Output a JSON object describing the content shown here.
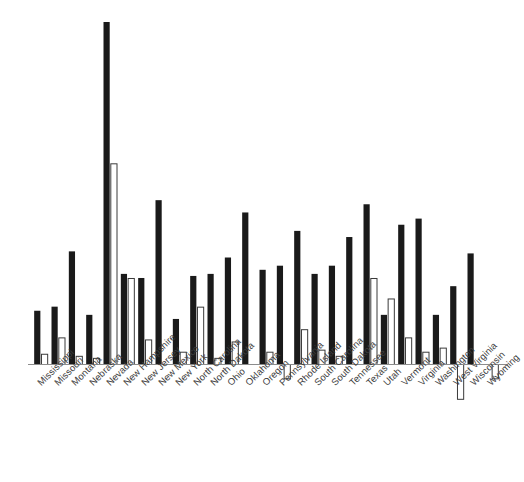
{
  "chart_data": {
    "type": "bar",
    "title": "",
    "subtitle": "",
    "xlabel": "",
    "ylabel": "",
    "grid": false,
    "legend_position": "none",
    "orientation": "vertical",
    "bar_style": "grouped-two-series",
    "ylim": [
      -20,
      340
    ],
    "axis_baseline": 0,
    "colors": {
      "series_dark": "#1a1a1a",
      "series_light": "#ffffff",
      "series_light_border": "#3a3a3a",
      "axis": "#8c8c8c",
      "label_text": "#3d3d3d",
      "background": "#ffffff"
    },
    "categories": [
      "Mississippi",
      "Missouri",
      "Montana",
      "Nebraska",
      "Nevada",
      "New Hampshire",
      "New Jersey",
      "New Mexico",
      "New York",
      "North Carolina",
      "North Dakota",
      "Ohio",
      "Oklahoma",
      "Oregon",
      "Pennsylvania",
      "Rhode Island",
      "South Carolina",
      "South Dakota",
      "Tennessee",
      "Texas",
      "Utah",
      "Vermont",
      "Virginia",
      "Washington",
      "West Virginia",
      "Wisconsin",
      "Wyoming"
    ],
    "series": [
      {
        "name": "series-dark",
        "values": [
          52,
          56,
          110,
          48,
          334,
          88,
          84,
          160,
          44,
          86,
          88,
          104,
          148,
          92,
          96,
          130,
          88,
          96,
          124,
          156,
          48,
          136,
          142,
          48,
          76,
          108,
          0
        ]
      },
      {
        "name": "series-light",
        "values": [
          10,
          26,
          8,
          6,
          196,
          84,
          24,
          0,
          12,
          56,
          6,
          22,
          0,
          12,
          -14,
          34,
          14,
          8,
          0,
          84,
          64,
          26,
          12,
          16,
          -34,
          0,
          -14
        ]
      }
    ]
  },
  "axis": {
    "baseline_label": "",
    "tick_labels": []
  }
}
